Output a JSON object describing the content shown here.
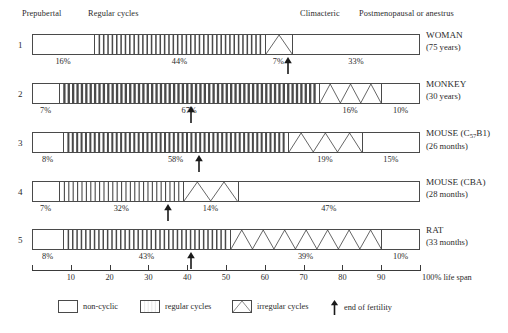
{
  "chart_data": {
    "type": "bar",
    "xlabel": "100% life span",
    "xlim": [
      0,
      100
    ],
    "grid": false,
    "legend_position": "bottom",
    "phase_headers": [
      {
        "label": "Prepubertal",
        "at_pct": 8
      },
      {
        "label": "Regular cycles",
        "at_pct": 30
      },
      {
        "label": "Climacteric",
        "at_pct": 66
      },
      {
        "label": "Postmenopausal or anestrus",
        "at_pct": 88
      }
    ],
    "axis_ticks": [
      {
        "value": 10,
        "label": "10"
      },
      {
        "value": 20,
        "label": "20"
      },
      {
        "value": 30,
        "label": "30"
      },
      {
        "value": 40,
        "label": "40"
      },
      {
        "value": 50,
        "label": "50"
      },
      {
        "value": 60,
        "label": "60"
      },
      {
        "value": 70,
        "label": "70"
      },
      {
        "value": 80,
        "label": "80"
      },
      {
        "value": 90,
        "label": "90"
      },
      {
        "value": 100,
        "label": "100% life span"
      }
    ],
    "rows": [
      {
        "number": "1",
        "species": "WOMAN",
        "lifespan": "(75 years)",
        "end_of_fertility_pct": 66,
        "segments": [
          {
            "type": "non-cyclic",
            "pct": 16,
            "label": "16%"
          },
          {
            "type": "regular",
            "pct": 44,
            "label": "44%"
          },
          {
            "type": "irregular",
            "pct": 7,
            "label": "7%"
          },
          {
            "type": "non-cyclic",
            "pct": 33,
            "label": "33%"
          }
        ]
      },
      {
        "number": "2",
        "species": "MONKEY",
        "lifespan": "(30 years)",
        "end_of_fertility_pct": 41,
        "segments": [
          {
            "type": "non-cyclic",
            "pct": 7,
            "label": "7%"
          },
          {
            "type": "regular",
            "pct": 67,
            "label": "67%"
          },
          {
            "type": "irregular",
            "pct": 16,
            "label": "16%"
          },
          {
            "type": "non-cyclic",
            "pct": 10,
            "label": "10%"
          }
        ]
      },
      {
        "number": "3",
        "species": "MOUSE (C57B1)",
        "species_prefix": "MOUSE (C",
        "species_sub": "57",
        "species_suffix": "B1)",
        "lifespan": "(26 months)",
        "end_of_fertility_pct": 43,
        "segments": [
          {
            "type": "non-cyclic",
            "pct": 8,
            "label": "8%"
          },
          {
            "type": "regular",
            "pct": 58,
            "label": "58%"
          },
          {
            "type": "irregular",
            "pct": 19,
            "label": "19%"
          },
          {
            "type": "non-cyclic",
            "pct": 15,
            "label": "15%"
          }
        ]
      },
      {
        "number": "4",
        "species": "MOUSE (CBA)",
        "lifespan": "(28 months)",
        "end_of_fertility_pct": 35,
        "segments": [
          {
            "type": "non-cyclic",
            "pct": 7,
            "label": "7%"
          },
          {
            "type": "regular",
            "pct": 32,
            "label": "32%"
          },
          {
            "type": "irregular",
            "pct": 14,
            "label": "14%"
          },
          {
            "type": "non-cyclic",
            "pct": 47,
            "label": "47%"
          }
        ]
      },
      {
        "number": "5",
        "species": "RAT",
        "lifespan": "(33 months)",
        "end_of_fertility_pct": 41,
        "segments": [
          {
            "type": "non-cyclic",
            "pct": 8,
            "label": "8%"
          },
          {
            "type": "regular",
            "pct": 43,
            "label": "43%"
          },
          {
            "type": "irregular",
            "pct": 39,
            "label": "39%"
          },
          {
            "type": "non-cyclic",
            "pct": 10,
            "label": "10%"
          }
        ]
      }
    ],
    "legend": [
      {
        "key": "non-cyclic",
        "label": "non-cyclic"
      },
      {
        "key": "regular",
        "label": "regular cycles"
      },
      {
        "key": "irregular",
        "label": "irregular cycles"
      },
      {
        "key": "end-of-fertility",
        "label": "end of fertility"
      }
    ],
    "colors": {
      "stroke": "#4a4a4a",
      "text": "#2b2b2b",
      "background": "#ffffff"
    }
  }
}
